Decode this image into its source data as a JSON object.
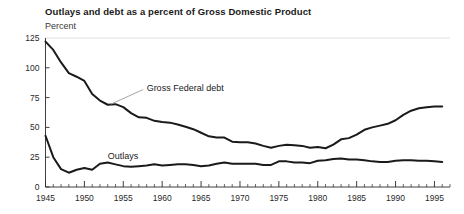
{
  "chart_data": {
    "type": "line",
    "title": "Outlays and debt as a percent of Gross Domestic Product",
    "subtitle": "Percent",
    "ylabel": "Percent",
    "xlabel": "",
    "grid": false,
    "legend_position": "inline-annotations",
    "xlim": [
      1945,
      1997
    ],
    "ylim": [
      0,
      125
    ],
    "yticks": [
      0,
      25,
      50,
      75,
      100,
      125
    ],
    "ytick_labels": [
      "0",
      "25",
      "50",
      "75",
      "100",
      "125"
    ],
    "xticks": [
      1945,
      1950,
      1955,
      1960,
      1965,
      1970,
      1975,
      1980,
      1985,
      1990,
      1995
    ],
    "xtick_labels": [
      "1945",
      "1950",
      "1955",
      "1960",
      "1965",
      "1970",
      "1975",
      "1980",
      "1985",
      "1990",
      "1995"
    ],
    "minor_xtick_interval": 1,
    "x": [
      1945,
      1946,
      1947,
      1948,
      1949,
      1950,
      1951,
      1952,
      1953,
      1954,
      1955,
      1956,
      1957,
      1958,
      1959,
      1960,
      1961,
      1962,
      1963,
      1964,
      1965,
      1966,
      1967,
      1968,
      1969,
      1970,
      1971,
      1972,
      1973,
      1974,
      1975,
      1976,
      1977,
      1978,
      1979,
      1980,
      1981,
      1982,
      1983,
      1984,
      1985,
      1986,
      1987,
      1988,
      1989,
      1990,
      1991,
      1992,
      1993,
      1994,
      1995,
      1996
    ],
    "series": [
      {
        "name": "Gross Federal debt",
        "color": "#1a1a1a",
        "label_x": 1958,
        "label_y": 83,
        "values": [
          122.0,
          115.0,
          104.5,
          95.5,
          92.5,
          89.0,
          78.0,
          72.5,
          69.0,
          69.5,
          67.0,
          62.0,
          58.5,
          58.0,
          55.5,
          54.5,
          54.0,
          52.5,
          50.5,
          48.5,
          45.5,
          42.5,
          41.5,
          41.5,
          38.0,
          37.5,
          37.5,
          36.5,
          34.5,
          33.0,
          34.5,
          35.5,
          35.0,
          34.5,
          33.0,
          33.5,
          32.5,
          35.5,
          40.0,
          41.0,
          44.0,
          48.0,
          50.0,
          51.5,
          53.0,
          56.0,
          60.5,
          64.0,
          66.0,
          67.0,
          67.5,
          67.5
        ]
      },
      {
        "name": "Outlays",
        "color": "#1a1a1a",
        "label_x": 1953,
        "label_y": 26,
        "values": [
          43.0,
          25.0,
          15.0,
          12.0,
          14.5,
          16.0,
          14.5,
          19.5,
          20.5,
          19.0,
          17.5,
          17.0,
          17.5,
          18.0,
          19.0,
          18.0,
          18.5,
          19.0,
          19.0,
          18.5,
          17.5,
          18.0,
          19.5,
          20.5,
          19.5,
          19.5,
          19.5,
          19.5,
          18.5,
          18.5,
          21.5,
          21.5,
          20.5,
          20.5,
          20.0,
          22.0,
          22.5,
          23.5,
          24.0,
          23.0,
          23.0,
          22.5,
          21.5,
          21.0,
          21.0,
          22.0,
          22.5,
          22.5,
          22.0,
          22.0,
          21.5,
          21.0
        ]
      }
    ],
    "annotations": [
      {
        "text": "Gross Federal debt",
        "type": "series-callout",
        "has_leader_line": true
      },
      {
        "text": "Outlays",
        "type": "series-callout",
        "has_leader_line": false
      }
    ]
  },
  "axis": {
    "ytick_0": "0",
    "ytick_25": "25",
    "ytick_50": "50",
    "ytick_75": "75",
    "ytick_100": "100",
    "ytick_125": "125",
    "xtick_1945": "1945",
    "xtick_1950": "1950",
    "xtick_1955": "1955",
    "xtick_1960": "1960",
    "xtick_1965": "1965",
    "xtick_1970": "1970",
    "xtick_1975": "1975",
    "xtick_1980": "1980",
    "xtick_1985": "1985",
    "xtick_1990": "1990",
    "xtick_1995": "1995"
  },
  "colors": {
    "line": "#1a1a1a",
    "axis": "#2a2a2a",
    "gridline_top": "#d8d8d8",
    "leader": "#9a9a9a",
    "background": "#ffffff"
  }
}
